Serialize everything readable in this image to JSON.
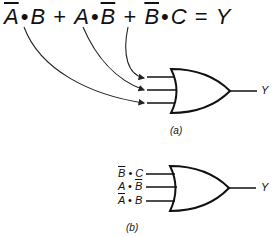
{
  "equation": {
    "terms": [
      {
        "parts": [
          {
            "text": "A",
            "bar": true
          },
          {
            "text": "•",
            "bar": false
          },
          {
            "text": "B",
            "bar": false
          }
        ]
      },
      {
        "parts": [
          {
            "text": "A",
            "bar": false
          },
          {
            "text": "•",
            "bar": false
          },
          {
            "text": "B",
            "bar": true
          }
        ]
      },
      {
        "parts": [
          {
            "text": "B",
            "bar": true
          },
          {
            "text": "•",
            "bar": false
          },
          {
            "text": "C",
            "bar": false
          }
        ]
      }
    ],
    "plus": "+",
    "equals": "=",
    "result": "Y",
    "t1a": "A",
    "t1dot": "•",
    "t1b": "B",
    "t2a": "A",
    "t2dot": "•",
    "t2b": "B",
    "t3a": "B",
    "t3dot": "•",
    "t3b": "C"
  },
  "figure_a": {
    "gate_type": "OR",
    "inputs": 3,
    "output_label": "Y",
    "caption": "(a)"
  },
  "figure_b": {
    "gate_type": "OR",
    "input_labels": [
      "B̄ • C",
      "A • B̄",
      "Ā • B"
    ],
    "output_label": "Y",
    "caption": "(b)",
    "in1_a": "B",
    "in1_dot": "•",
    "in1_b": "C",
    "in2_a": "A",
    "in2_dot": "•",
    "in2_b": "B",
    "in3_a": "A",
    "in3_dot": "•",
    "in3_b": "B"
  }
}
